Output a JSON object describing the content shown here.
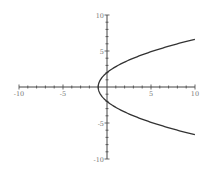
{
  "chart_data": {
    "type": "line",
    "title": "",
    "xlabel": "",
    "ylabel": "",
    "xlim": [
      -10,
      10
    ],
    "ylim": [
      -10,
      10
    ],
    "grid": false,
    "legend": null,
    "axes_through_origin": true,
    "x_tick_labels": [
      "-10",
      "-5",
      "5",
      "10"
    ],
    "y_tick_labels": [
      "10",
      "5",
      "-5",
      "-10"
    ],
    "x_ticks": [
      -10,
      -5,
      5,
      10
    ],
    "y_ticks": [
      10,
      5,
      -5,
      -10
    ],
    "series": [
      {
        "name": "parabola x = y^2/4 - 1",
        "color": "#333333",
        "points": [
          [
            10,
            6.63
          ],
          [
            8,
            6.0
          ],
          [
            6,
            5.29
          ],
          [
            4,
            4.47
          ],
          [
            3,
            4.0
          ],
          [
            2,
            3.46
          ],
          [
            1,
            2.83
          ],
          [
            0,
            2.0
          ],
          [
            -0.5,
            1.41
          ],
          [
            -0.75,
            1.0
          ],
          [
            -1,
            0
          ],
          [
            -0.75,
            -1.0
          ],
          [
            -0.5,
            -1.41
          ],
          [
            0,
            -2.0
          ],
          [
            1,
            -2.83
          ],
          [
            2,
            -3.46
          ],
          [
            3,
            -4.0
          ],
          [
            4,
            -4.47
          ],
          [
            6,
            -5.29
          ],
          [
            8,
            -6.0
          ],
          [
            10,
            -6.63
          ]
        ]
      }
    ]
  },
  "colors": {
    "axis": "#444444",
    "curve": "#333333",
    "label": "#777777",
    "background": "#ffffff"
  }
}
